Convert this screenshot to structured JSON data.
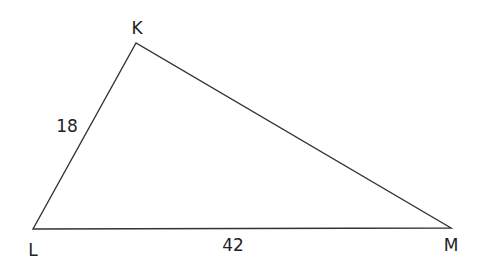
{
  "diagram": {
    "type": "triangle",
    "stroke_color": "#333333",
    "vertices": [
      {
        "label": "K",
        "x": 136,
        "y": 43,
        "lx": 137,
        "ly": 34
      },
      {
        "label": "L",
        "x": 33,
        "y": 229,
        "lx": 33,
        "ly": 256
      },
      {
        "label": "M",
        "x": 451,
        "y": 228,
        "lx": 451,
        "ly": 251
      }
    ],
    "sides": [
      {
        "between": "KL",
        "length_label": "18",
        "lx": 67,
        "ly": 132
      },
      {
        "between": "LM",
        "length_label": "42",
        "lx": 233,
        "ly": 251
      }
    ]
  }
}
